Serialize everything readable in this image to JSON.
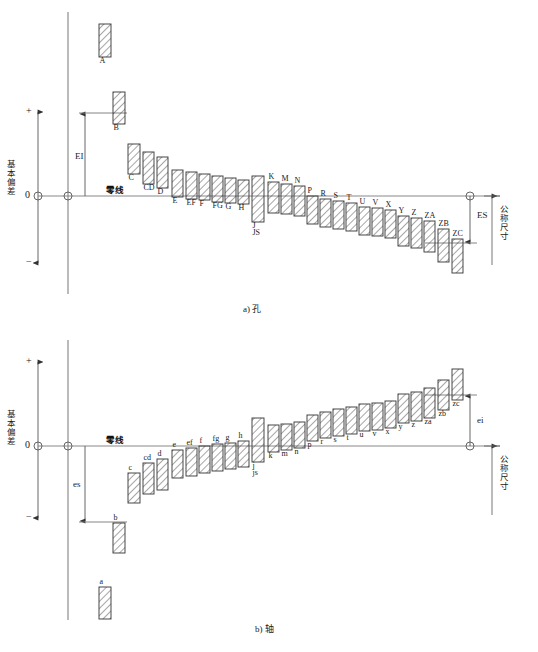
{
  "figure": {
    "title_hole": "a) 孔",
    "title_shaft": "b) 轴",
    "zero_line_label": "零线",
    "basic_deviation_label": "基本偏差",
    "nominal_size_label": "公称尺寸",
    "axis_plus": "+",
    "axis_minus": "−",
    "axis_zero": "0",
    "hatch_color": "#333333",
    "line_color": "#555555",
    "text_color": "#1a1a1a"
  },
  "hole": {
    "caption": "a) 孔",
    "deviation_arrow_label": "EI",
    "upper_deviation_label": "ES",
    "zero_line_label": "零线",
    "axis_label": "基本偏差",
    "nominal_label": "公称尺寸",
    "zones": [
      {
        "label": "A",
        "x": 99,
        "w": 12,
        "top": 24,
        "bottom": 57,
        "label_pos": "below"
      },
      {
        "label": "B",
        "x": 113,
        "w": 12,
        "top": 92,
        "bottom": 124,
        "label_pos": "below"
      },
      {
        "label": "C",
        "x": 128,
        "w": 12,
        "top": 144,
        "bottom": 174,
        "label_pos": "below"
      },
      {
        "label": "CD",
        "x": 143,
        "w": 11,
        "top": 152,
        "bottom": 184,
        "label_pos": "below"
      },
      {
        "label": "D",
        "x": 157,
        "w": 11,
        "top": 157,
        "bottom": 188,
        "label_pos": "below"
      },
      {
        "label": "E",
        "x": 172,
        "w": 11,
        "top": 170,
        "bottom": 197,
        "label_pos": "below"
      },
      {
        "label": "EF",
        "x": 186,
        "w": 11,
        "top": 172,
        "bottom": 199,
        "label_pos": "below"
      },
      {
        "label": "F",
        "x": 199,
        "w": 11,
        "top": 174,
        "bottom": 200,
        "label_pos": "below"
      },
      {
        "label": "FG",
        "x": 212,
        "w": 11,
        "top": 176,
        "bottom": 202,
        "label_pos": "below"
      },
      {
        "label": "G",
        "x": 225,
        "w": 11,
        "top": 178,
        "bottom": 203,
        "label_pos": "below"
      },
      {
        "label": "H",
        "x": 238,
        "w": 11,
        "top": 180,
        "bottom": 204,
        "label_pos": "below"
      },
      {
        "label": "J",
        "x": 252,
        "w": 12,
        "top": 176,
        "bottom": 222,
        "label_pos": "below"
      },
      {
        "label": "JS",
        "x": 252,
        "w": 12,
        "top": 176,
        "bottom": 222,
        "label_pos": "below2"
      },
      {
        "label": "K",
        "x": 268,
        "w": 11,
        "top": 182,
        "bottom": 213,
        "label_pos": "above"
      },
      {
        "label": "M",
        "x": 281,
        "w": 11,
        "top": 184,
        "bottom": 214,
        "label_pos": "above"
      },
      {
        "label": "N",
        "x": 294,
        "w": 11,
        "top": 186,
        "bottom": 216,
        "label_pos": "above"
      },
      {
        "label": "P",
        "x": 307,
        "w": 11,
        "top": 196,
        "bottom": 224,
        "label_pos": "above"
      },
      {
        "label": "R",
        "x": 320,
        "w": 11,
        "top": 199,
        "bottom": 227,
        "label_pos": "above"
      },
      {
        "label": "S",
        "x": 333,
        "w": 11,
        "top": 201,
        "bottom": 229,
        "label_pos": "above"
      },
      {
        "label": "T",
        "x": 346,
        "w": 11,
        "top": 203,
        "bottom": 231,
        "label_pos": "above"
      },
      {
        "label": "U",
        "x": 359,
        "w": 11,
        "top": 207,
        "bottom": 235,
        "label_pos": "above"
      },
      {
        "label": "V",
        "x": 372,
        "w": 11,
        "top": 208,
        "bottom": 236,
        "label_pos": "above"
      },
      {
        "label": "X",
        "x": 385,
        "w": 11,
        "top": 210,
        "bottom": 238,
        "label_pos": "above"
      },
      {
        "label": "Y",
        "x": 398,
        "w": 11,
        "top": 216,
        "bottom": 246,
        "label_pos": "above"
      },
      {
        "label": "Z",
        "x": 411,
        "w": 11,
        "top": 218,
        "bottom": 248,
        "label_pos": "above"
      },
      {
        "label": "ZA",
        "x": 424,
        "w": 11,
        "top": 221,
        "bottom": 252,
        "label_pos": "above"
      },
      {
        "label": "ZB",
        "x": 438,
        "w": 11,
        "top": 229,
        "bottom": 262,
        "label_pos": "above"
      },
      {
        "label": "ZC",
        "x": 452,
        "w": 11,
        "top": 239,
        "bottom": 273,
        "label_pos": "above"
      }
    ]
  },
  "shaft": {
    "caption": "b) 轴",
    "deviation_arrow_label": "es",
    "lower_deviation_label": "ei",
    "zero_line_label": "零线",
    "axis_label": "基本偏差",
    "nominal_label": "公称尺寸",
    "zones": [
      {
        "label": "a",
        "x": 99,
        "w": 12,
        "top": 587,
        "bottom": 619,
        "label_pos": "above"
      },
      {
        "label": "b",
        "x": 113,
        "w": 12,
        "top": 523,
        "bottom": 553,
        "label_pos": "above"
      },
      {
        "label": "c",
        "x": 128,
        "w": 12,
        "top": 473,
        "bottom": 503,
        "label_pos": "above"
      },
      {
        "label": "cd",
        "x": 143,
        "w": 11,
        "top": 463,
        "bottom": 494,
        "label_pos": "above"
      },
      {
        "label": "d",
        "x": 157,
        "w": 11,
        "top": 459,
        "bottom": 490,
        "label_pos": "above"
      },
      {
        "label": "e",
        "x": 172,
        "w": 11,
        "top": 450,
        "bottom": 478,
        "label_pos": "above"
      },
      {
        "label": "ef",
        "x": 186,
        "w": 11,
        "top": 448,
        "bottom": 476,
        "label_pos": "above"
      },
      {
        "label": "f",
        "x": 199,
        "w": 11,
        "top": 446,
        "bottom": 473,
        "label_pos": "above"
      },
      {
        "label": "fg",
        "x": 212,
        "w": 11,
        "top": 444,
        "bottom": 471,
        "label_pos": "above"
      },
      {
        "label": "g",
        "x": 225,
        "w": 11,
        "top": 443,
        "bottom": 469,
        "label_pos": "above"
      },
      {
        "label": "h",
        "x": 238,
        "w": 11,
        "top": 441,
        "bottom": 467,
        "label_pos": "above"
      },
      {
        "label": "j",
        "x": 252,
        "w": 12,
        "top": 418,
        "bottom": 462,
        "label_pos": "below"
      },
      {
        "label": "js",
        "x": 252,
        "w": 12,
        "top": 418,
        "bottom": 462,
        "label_pos": "below2"
      },
      {
        "label": "k",
        "x": 268,
        "w": 11,
        "top": 425,
        "bottom": 452,
        "label_pos": "below"
      },
      {
        "label": "m",
        "x": 281,
        "w": 11,
        "top": 424,
        "bottom": 450,
        "label_pos": "below"
      },
      {
        "label": "n",
        "x": 294,
        "w": 11,
        "top": 422,
        "bottom": 448,
        "label_pos": "below"
      },
      {
        "label": "p",
        "x": 307,
        "w": 11,
        "top": 415,
        "bottom": 441,
        "label_pos": "below"
      },
      {
        "label": "r",
        "x": 320,
        "w": 11,
        "top": 412,
        "bottom": 438,
        "label_pos": "below"
      },
      {
        "label": "s",
        "x": 333,
        "w": 11,
        "top": 409,
        "bottom": 436,
        "label_pos": "below"
      },
      {
        "label": "t",
        "x": 346,
        "w": 11,
        "top": 407,
        "bottom": 434,
        "label_pos": "below"
      },
      {
        "label": "u",
        "x": 359,
        "w": 11,
        "top": 404,
        "bottom": 431,
        "label_pos": "below"
      },
      {
        "label": "v",
        "x": 372,
        "w": 11,
        "top": 403,
        "bottom": 430,
        "label_pos": "below"
      },
      {
        "label": "x",
        "x": 385,
        "w": 11,
        "top": 401,
        "bottom": 428,
        "label_pos": "below"
      },
      {
        "label": "y",
        "x": 398,
        "w": 11,
        "top": 394,
        "bottom": 423,
        "label_pos": "below"
      },
      {
        "label": "z",
        "x": 411,
        "w": 11,
        "top": 392,
        "bottom": 421,
        "label_pos": "below"
      },
      {
        "label": "za",
        "x": 424,
        "w": 11,
        "top": 388,
        "bottom": 418,
        "label_pos": "below"
      },
      {
        "label": "zb",
        "x": 438,
        "w": 11,
        "top": 380,
        "bottom": 410,
        "label_pos": "below"
      },
      {
        "label": "zc",
        "x": 452,
        "w": 11,
        "top": 369,
        "bottom": 400,
        "label_pos": "below"
      }
    ]
  },
  "chart_data": {
    "type": "bar",
    "xlabel": "公称尺寸",
    "ylabel": "基本偏差",
    "panels": [
      {
        "name": "a) 孔",
        "categories": [
          "A",
          "B",
          "C",
          "CD",
          "D",
          "E",
          "EF",
          "F",
          "FG",
          "G",
          "H",
          "J",
          "JS",
          "K",
          "M",
          "N",
          "P",
          "R",
          "S",
          "T",
          "U",
          "V",
          "X",
          "Y",
          "Z",
          "ZA",
          "ZB",
          "ZC"
        ],
        "note": "孔的基本偏差：A–H 为下偏差 EI（正），J/JS 跨零线，K–ZC 为上偏差 ES（负）"
      },
      {
        "name": "b) 轴",
        "categories": [
          "a",
          "b",
          "c",
          "cd",
          "d",
          "e",
          "ef",
          "f",
          "fg",
          "g",
          "h",
          "j",
          "js",
          "k",
          "m",
          "n",
          "p",
          "r",
          "s",
          "t",
          "u",
          "v",
          "x",
          "y",
          "z",
          "za",
          "zb",
          "zc"
        ],
        "note": "轴的基本偏差：a–h 为上偏差 es（负），j/js 跨零线，k–zc 为下偏差 ei（正）"
      }
    ]
  }
}
